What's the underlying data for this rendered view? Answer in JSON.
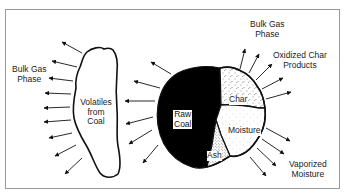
{
  "diagram": {
    "title": "",
    "labels": {
      "bulk_gas_left": [
        "Bulk Gas",
        "Phase"
      ],
      "bulk_gas_top": [
        "Bulk Gas",
        "Phase"
      ],
      "oxidized_char": [
        "Oxidized Char",
        "Products"
      ],
      "volatiles": [
        "Volatiles",
        "from",
        "Coal"
      ],
      "raw_coal": [
        "Raw",
        "Coal"
      ],
      "char": "Char",
      "moisture": "Moisture",
      "ash": "Ash",
      "vaporized_moisture": [
        "Vaporized",
        "Moisture"
      ]
    },
    "colors": {
      "outline": "#111111",
      "raw_coal_fill": "#000000",
      "frame": "#9a9a9a",
      "background": "#ffffff"
    }
  }
}
